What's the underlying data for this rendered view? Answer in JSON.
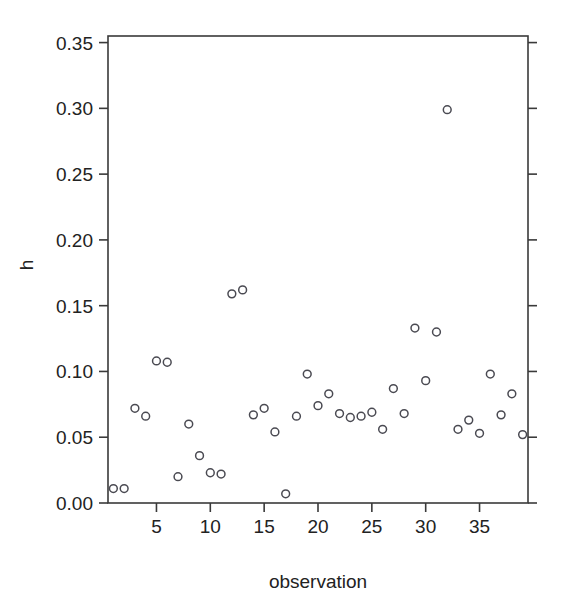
{
  "chart_data": {
    "type": "scatter",
    "title": "",
    "xlabel": "observation",
    "ylabel": "h",
    "xlim": [
      0.5,
      39.5
    ],
    "ylim": [
      0.0,
      0.355
    ],
    "grid": false,
    "legend": null,
    "marker": "open-circle",
    "marker_color": "#4a4a52",
    "x_ticks": [
      5,
      10,
      15,
      20,
      25,
      30,
      35
    ],
    "x_tick_labels": [
      "5",
      "10",
      "15",
      "20",
      "25",
      "30",
      "35"
    ],
    "y_ticks": [
      0.0,
      0.05,
      0.1,
      0.15,
      0.2,
      0.25,
      0.3,
      0.35
    ],
    "y_tick_labels": [
      "0.00",
      "0.05",
      "0.10",
      "0.15",
      "0.20",
      "0.25",
      "0.30",
      "0.35"
    ],
    "x": [
      1,
      2,
      3,
      4,
      5,
      6,
      7,
      8,
      9,
      10,
      11,
      12,
      13,
      14,
      15,
      16,
      17,
      18,
      19,
      20,
      21,
      22,
      23,
      24,
      25,
      26,
      27,
      28,
      29,
      30,
      31,
      32,
      33,
      34,
      35,
      36,
      37,
      38,
      39
    ],
    "y": [
      0.011,
      0.011,
      0.072,
      0.066,
      0.108,
      0.107,
      0.02,
      0.06,
      0.036,
      0.023,
      0.022,
      0.159,
      0.162,
      0.067,
      0.072,
      0.054,
      0.007,
      0.066,
      0.098,
      0.074,
      0.083,
      0.068,
      0.065,
      0.066,
      0.069,
      0.056,
      0.087,
      0.068,
      0.133,
      0.093,
      0.13,
      0.299,
      0.056,
      0.063,
      0.053,
      0.098,
      0.067,
      0.083,
      0.052
    ],
    "points": [
      {
        "observation": 1,
        "h": 0.011
      },
      {
        "observation": 2,
        "h": 0.011
      },
      {
        "observation": 3,
        "h": 0.072
      },
      {
        "observation": 4,
        "h": 0.066
      },
      {
        "observation": 5,
        "h": 0.108
      },
      {
        "observation": 6,
        "h": 0.107
      },
      {
        "observation": 7,
        "h": 0.02
      },
      {
        "observation": 8,
        "h": 0.06
      },
      {
        "observation": 9,
        "h": 0.036
      },
      {
        "observation": 10,
        "h": 0.023
      },
      {
        "observation": 11,
        "h": 0.022
      },
      {
        "observation": 12,
        "h": 0.159
      },
      {
        "observation": 13,
        "h": 0.162
      },
      {
        "observation": 14,
        "h": 0.067
      },
      {
        "observation": 15,
        "h": 0.072
      },
      {
        "observation": 16,
        "h": 0.054
      },
      {
        "observation": 17,
        "h": 0.007
      },
      {
        "observation": 18,
        "h": 0.066
      },
      {
        "observation": 19,
        "h": 0.098
      },
      {
        "observation": 20,
        "h": 0.074
      },
      {
        "observation": 21,
        "h": 0.083
      },
      {
        "observation": 22,
        "h": 0.068
      },
      {
        "observation": 23,
        "h": 0.065
      },
      {
        "observation": 24,
        "h": 0.066
      },
      {
        "observation": 25,
        "h": 0.069
      },
      {
        "observation": 26,
        "h": 0.056
      },
      {
        "observation": 27,
        "h": 0.087
      },
      {
        "observation": 28,
        "h": 0.068
      },
      {
        "observation": 29,
        "h": 0.133
      },
      {
        "observation": 30,
        "h": 0.093
      },
      {
        "observation": 31,
        "h": 0.13
      },
      {
        "observation": 32,
        "h": 0.299
      },
      {
        "observation": 33,
        "h": 0.056
      },
      {
        "observation": 34,
        "h": 0.063
      },
      {
        "observation": 35,
        "h": 0.053
      },
      {
        "observation": 36,
        "h": 0.098
      },
      {
        "observation": 37,
        "h": 0.067
      },
      {
        "observation": 38,
        "h": 0.083
      },
      {
        "observation": 39,
        "h": 0.052
      }
    ]
  },
  "layout": {
    "plot_left": 108,
    "plot_right": 528,
    "plot_top": 36,
    "plot_bottom": 503,
    "axis_color": "#3a3a3a",
    "background": "#ffffff"
  }
}
